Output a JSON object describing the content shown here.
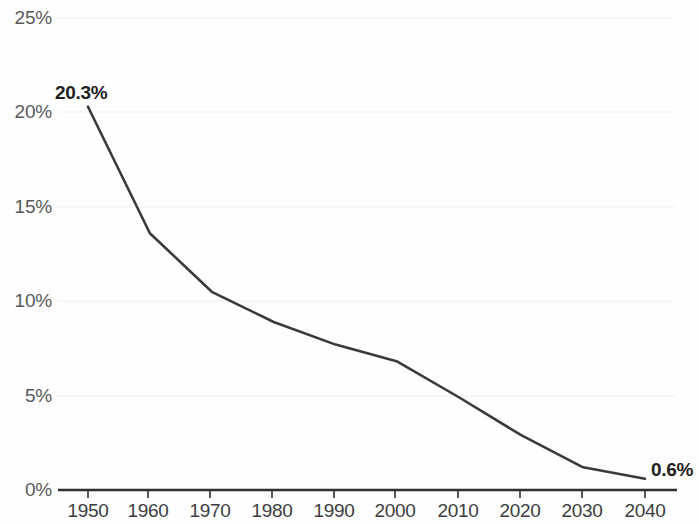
{
  "chart_data": {
    "type": "line",
    "title": "",
    "subtitle": "",
    "xlabel": "",
    "ylabel": "",
    "x": [
      1950,
      1960,
      1970,
      1980,
      1990,
      2000,
      2010,
      2020,
      2030,
      2040
    ],
    "values": [
      20.3,
      13.6,
      10.5,
      8.9,
      7.7,
      6.8,
      4.9,
      2.9,
      1.2,
      0.6
    ],
    "series": [
      {
        "name": "",
        "values": [
          20.3,
          13.6,
          10.5,
          8.9,
          7.7,
          6.8,
          4.9,
          2.9,
          1.2,
          0.6
        ]
      }
    ],
    "xlim": [
      1950,
      2040
    ],
    "ylim": [
      0,
      25
    ],
    "x_tick_labels": [
      "1950",
      "1960",
      "1970",
      "1980",
      "1990",
      "2000",
      "2010",
      "2020",
      "2030",
      "2040"
    ],
    "y_tick_values": [
      0,
      5,
      10,
      15,
      20,
      25
    ],
    "y_tick_labels": [
      "0%",
      "5%",
      "10%",
      "15%",
      "20%",
      "25%"
    ],
    "grid": false,
    "legend": false,
    "legend_position": "none",
    "annotations": [
      {
        "id": "start",
        "text": "20.3%",
        "x": 1950,
        "y": 20.3
      },
      {
        "id": "end",
        "text": "0.6%",
        "x": 2040,
        "y": 0.6
      }
    ],
    "colors": {
      "line": "#3a3a3c",
      "axis": "#2f2f31",
      "tick_label": "#58585a",
      "annotation": "#231f20",
      "background": "#fefefe"
    }
  }
}
